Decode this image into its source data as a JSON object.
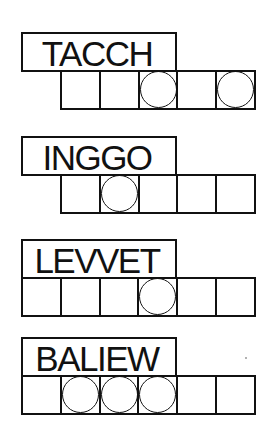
{
  "puzzle": {
    "type": "jumble",
    "jumbles": [
      {
        "scrambled": "TACCH",
        "letters": 5,
        "circled_positions": [
          3,
          5
        ]
      },
      {
        "scrambled": "INGGO",
        "letters": 5,
        "circled_positions": [
          2
        ]
      },
      {
        "scrambled": "LEVVET",
        "letters": 6,
        "circled_positions": [
          4
        ]
      },
      {
        "scrambled": "BALIEW",
        "letters": 6,
        "circled_positions": [
          2,
          3,
          4
        ]
      }
    ]
  },
  "colors": {
    "ink": "#111111",
    "background": "#ffffff"
  }
}
